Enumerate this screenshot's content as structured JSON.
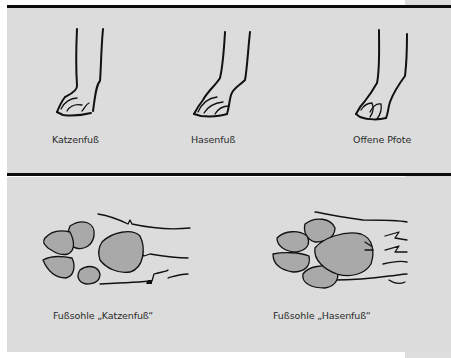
{
  "figure": {
    "top_section": {
      "items": [
        {
          "label": "Katzenfuß",
          "icon": "cat-foot-icon"
        },
        {
          "label": "Hasenfuß",
          "icon": "hare-foot-icon"
        },
        {
          "label": "Offene Pfote",
          "icon": "open-paw-icon"
        }
      ]
    },
    "bottom_section": {
      "items": [
        {
          "label": "Fußsohle „Katzenfuß“",
          "icon": "cat-foot-sole-icon"
        },
        {
          "label": "Fußsohle „Hasenfuß“",
          "icon": "hare-foot-sole-icon"
        }
      ]
    }
  },
  "colors": {
    "panel_background": "#dcdcdc",
    "pad_fill": "#a9a9a9",
    "rule": "#0c0c0c",
    "line": "#111111"
  }
}
